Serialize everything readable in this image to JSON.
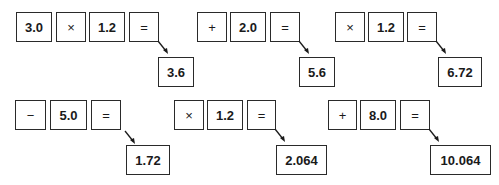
{
  "colors": {
    "stroke": "#2a2a2a",
    "text": "#1a1a1a",
    "background": "#ffffff"
  },
  "steps": [
    {
      "input": "3.0",
      "operator": "×",
      "operand": "1.2",
      "equals": "=",
      "result": "3.6"
    },
    {
      "operator": "+",
      "operand": "2.0",
      "equals": "=",
      "result": "5.6"
    },
    {
      "operator": "×",
      "operand": "1.2",
      "equals": "=",
      "result": "6.72"
    },
    {
      "operator": "−",
      "operand": "5.0",
      "equals": "=",
      "result": "1.72"
    },
    {
      "operator": "×",
      "operand": "1.2",
      "equals": "=",
      "result": "2.064"
    },
    {
      "operator": "+",
      "operand": "8.0",
      "equals": "=",
      "result": "10.064"
    }
  ]
}
